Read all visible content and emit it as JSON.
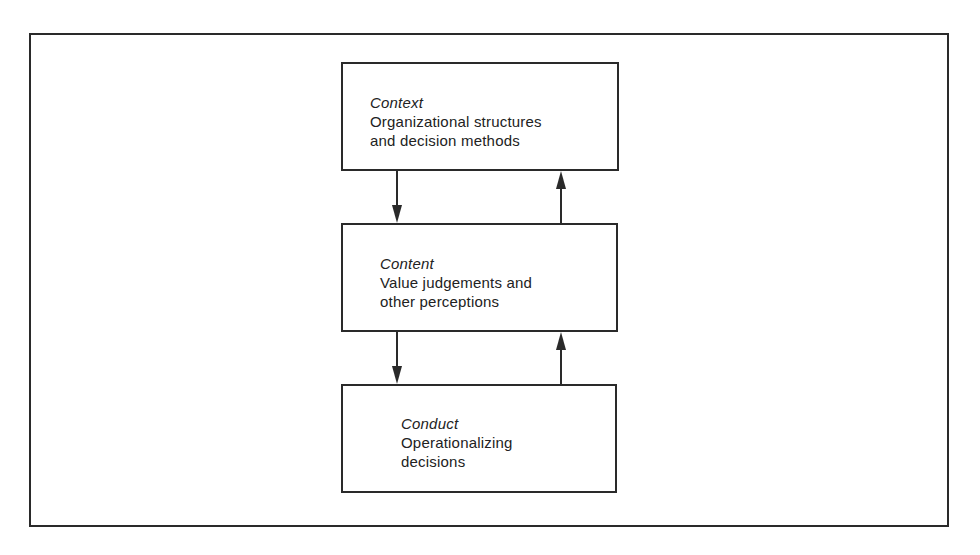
{
  "diagram": {
    "type": "flow",
    "direction": "vertical",
    "boxes": [
      {
        "id": "context",
        "title": "Context",
        "description": "Organizational structures\nand decision methods"
      },
      {
        "id": "content",
        "title": "Content",
        "description": "Value judgements and\nother perceptions"
      },
      {
        "id": "conduct",
        "title": "Conduct",
        "description": "Operationalizing\ndecisions"
      }
    ],
    "connections": [
      {
        "from": "context",
        "to": "content",
        "direction": "down"
      },
      {
        "from": "content",
        "to": "context",
        "direction": "up"
      },
      {
        "from": "content",
        "to": "conduct",
        "direction": "down"
      },
      {
        "from": "conduct",
        "to": "content",
        "direction": "up"
      }
    ],
    "colors": {
      "line": "#2a2a2a",
      "background": "#ffffff",
      "text": "#222222"
    }
  },
  "caption": {
    "text": ""
  }
}
